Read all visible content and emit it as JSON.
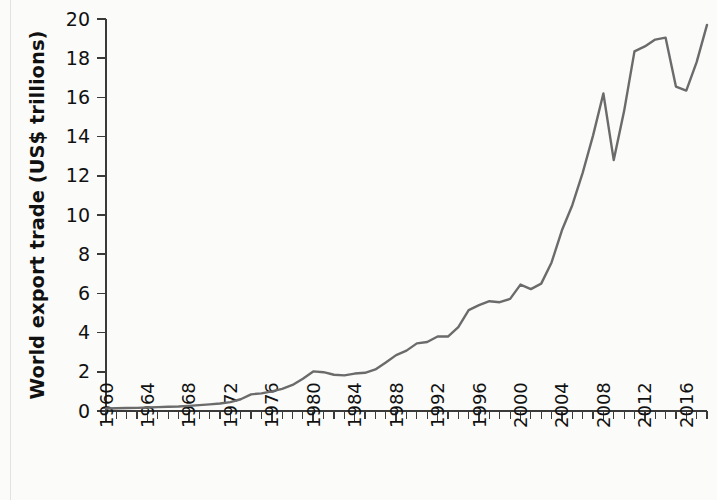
{
  "chart_data": {
    "type": "line",
    "title": "",
    "xlabel": "",
    "ylabel": "World export trade (US$ trillions)",
    "xlim": [
      1960,
      2018
    ],
    "ylim": [
      0,
      20
    ],
    "grid": false,
    "legend": null,
    "line_color": "#6b6b6b",
    "axis_color": "#3a3a3a",
    "background_color": "#fbfbfa",
    "y_ticks": [
      0,
      2,
      4,
      6,
      8,
      10,
      12,
      14,
      16,
      18,
      20
    ],
    "y_tick_labels": [
      "0",
      "2",
      "4",
      "6",
      "8",
      "10",
      "12",
      "14",
      "16",
      "18",
      "20"
    ],
    "x_ticks_major": [
      1960,
      1964,
      1968,
      1972,
      1976,
      1980,
      1984,
      1988,
      1992,
      1996,
      2000,
      2004,
      2008,
      2012,
      2016
    ],
    "x_tick_labels": [
      "1960",
      "1964",
      "1968",
      "1972",
      "1976",
      "1980",
      "1984",
      "1988",
      "1992",
      "1996",
      "2000",
      "2004",
      "2008",
      "2012",
      "2016"
    ],
    "x_minor_tick_interval": 1,
    "x_tick_label_rotation": -90,
    "series": [
      {
        "name": "World export trade",
        "x": [
          1960,
          1961,
          1962,
          1963,
          1964,
          1965,
          1966,
          1967,
          1968,
          1969,
          1970,
          1971,
          1972,
          1973,
          1974,
          1975,
          1976,
          1977,
          1978,
          1979,
          1980,
          1981,
          1982,
          1983,
          1984,
          1985,
          1986,
          1987,
          1988,
          1989,
          1990,
          1991,
          1992,
          1993,
          1994,
          1995,
          1996,
          1997,
          1998,
          1999,
          2000,
          2001,
          2002,
          2003,
          2004,
          2005,
          2006,
          2007,
          2008,
          2009,
          2010,
          2011,
          2012,
          2013,
          2014,
          2015,
          2016,
          2017,
          2018
        ],
        "values": [
          0.13,
          0.14,
          0.15,
          0.16,
          0.18,
          0.2,
          0.22,
          0.23,
          0.26,
          0.3,
          0.34,
          0.38,
          0.45,
          0.6,
          0.85,
          0.9,
          1.0,
          1.13,
          1.33,
          1.65,
          2.02,
          1.98,
          1.85,
          1.82,
          1.91,
          1.95,
          2.12,
          2.47,
          2.85,
          3.08,
          3.45,
          3.52,
          3.8,
          3.8,
          4.28,
          5.15,
          5.4,
          5.6,
          5.55,
          5.72,
          6.45,
          6.22,
          6.5,
          7.58,
          9.22,
          10.5,
          12.15,
          14.05,
          16.2,
          12.8,
          15.3,
          18.35,
          18.6,
          18.95,
          19.05,
          16.55,
          16.35,
          17.8,
          19.7
        ],
        "color": "#6b6b6b"
      }
    ]
  }
}
